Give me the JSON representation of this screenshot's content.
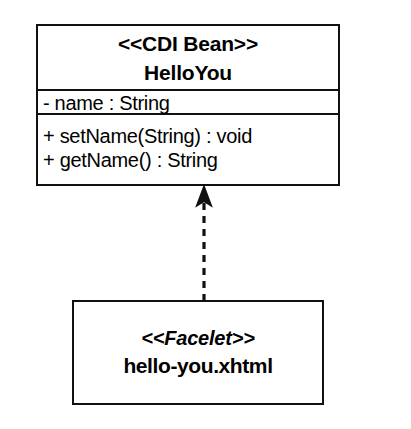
{
  "diagram": {
    "type": "uml-class-diagram",
    "background_color": "#ffffff",
    "line_color": "#111111",
    "classes": [
      {
        "id": "hello-you",
        "stereotype": "<<CDI Bean>>",
        "name": "HelloYou",
        "attributes": [
          {
            "visibility": "-",
            "text": "- name : String"
          }
        ],
        "operations": [
          {
            "visibility": "+",
            "text": "+ setName(String) : void"
          },
          {
            "visibility": "+",
            "text": "+ getName() : String"
          }
        ]
      },
      {
        "id": "hello-you-facelet",
        "stereotype": "<<Facelet>>",
        "name": "hello-you.xhtml",
        "attributes": [],
        "operations": []
      }
    ],
    "relationships": [
      {
        "id": "facelet-to-bean",
        "kind": "dependency",
        "line_style": "dashed",
        "arrowhead": "open-triangle",
        "from": "hello-you-facelet",
        "to": "hello-you",
        "label": ""
      }
    ]
  }
}
